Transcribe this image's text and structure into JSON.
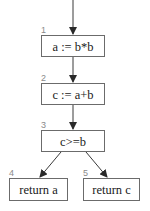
{
  "diagram": {
    "type": "control-flow-graph",
    "nodes": [
      {
        "id": "1",
        "label": "1",
        "text": "a := b*b"
      },
      {
        "id": "2",
        "label": "2",
        "text": "c := a+b"
      },
      {
        "id": "3",
        "label": "3",
        "text": "c>=b"
      },
      {
        "id": "4",
        "label": "4",
        "text": "return a"
      },
      {
        "id": "5",
        "label": "5",
        "text": "return c"
      }
    ],
    "edges": [
      {
        "from": "entry",
        "to": "1"
      },
      {
        "from": "1",
        "to": "2"
      },
      {
        "from": "2",
        "to": "3"
      },
      {
        "from": "3",
        "to": "4"
      },
      {
        "from": "3",
        "to": "5"
      }
    ],
    "colors": {
      "box_border": "#6b6b6b",
      "edge": "#3a3a3a",
      "node_label": "#8a8a8a",
      "text": "#1a1a1a"
    }
  }
}
